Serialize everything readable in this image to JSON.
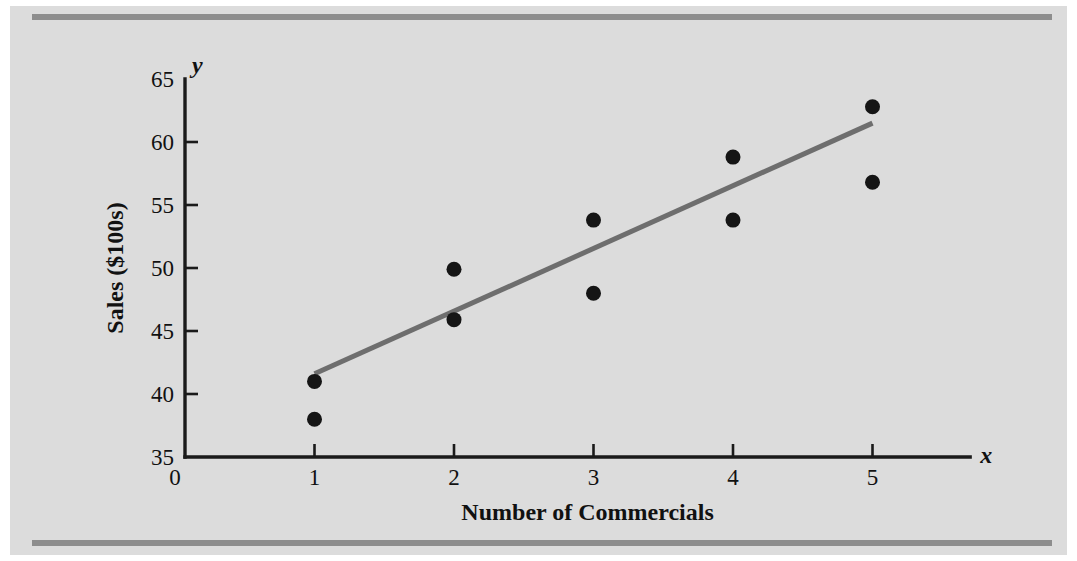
{
  "figure": {
    "background_color": "#dcdcdc",
    "rule_color": "#8d8d8d"
  },
  "chart_data": {
    "type": "scatter",
    "title": "",
    "xlabel": "Number of Commercials",
    "ylabel": "Sales ($100s)",
    "x_axis_symbol": "x",
    "y_axis_symbol": "y",
    "xlim": [
      0,
      5.7
    ],
    "ylim": [
      35,
      65
    ],
    "xticks": [
      0,
      1,
      2,
      3,
      4,
      5
    ],
    "xtick_labels": [
      "0",
      "1",
      "2",
      "3",
      "4",
      "5"
    ],
    "yticks": [
      35,
      40,
      45,
      50,
      55,
      60,
      65
    ],
    "ytick_labels": [
      "35",
      "40",
      "45",
      "50",
      "55",
      "60",
      "65"
    ],
    "grid": false,
    "legend": false,
    "point_color": "#151515",
    "line_color": "#6e6e6e",
    "points": [
      {
        "x": 1,
        "y": 41
      },
      {
        "x": 1,
        "y": 38
      },
      {
        "x": 2,
        "y": 49.9
      },
      {
        "x": 2,
        "y": 45.9
      },
      {
        "x": 3,
        "y": 53.8
      },
      {
        "x": 3,
        "y": 48
      },
      {
        "x": 4,
        "y": 58.8
      },
      {
        "x": 4,
        "y": 53.8
      },
      {
        "x": 5,
        "y": 62.8
      },
      {
        "x": 5,
        "y": 56.8
      }
    ],
    "fit_line": {
      "label": "regression line",
      "x_start": 1,
      "y_start": 41.6,
      "x_end": 5,
      "y_end": 61.5
    }
  }
}
